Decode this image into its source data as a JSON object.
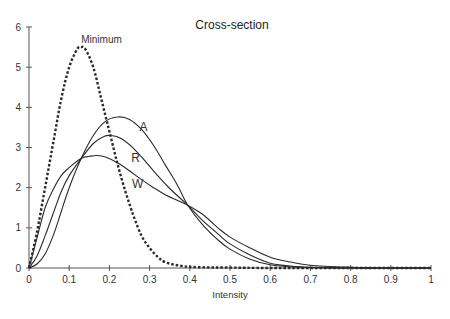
{
  "chart_data": {
    "type": "line",
    "title": "Cross-section",
    "xlabel": "Intensity",
    "ylabel": "",
    "xlim": [
      0,
      1
    ],
    "ylim": [
      0,
      6
    ],
    "grid": false,
    "legend": "inline labels",
    "x_ticks": [
      "0",
      "0.1",
      "0.2",
      "0.3",
      "0.4",
      "0.5",
      "0.6",
      "0.7",
      "0.8",
      "0.9",
      "1"
    ],
    "y_ticks": [
      "0",
      "1",
      "2",
      "3",
      "4",
      "5",
      "6"
    ],
    "series": [
      {
        "name": "Minimum",
        "style": "dashed",
        "x": [
          0,
          0.02,
          0.04,
          0.06,
          0.08,
          0.1,
          0.12,
          0.13,
          0.14,
          0.16,
          0.18,
          0.2,
          0.22,
          0.24,
          0.26,
          0.28,
          0.3,
          0.32,
          0.34,
          0.38,
          0.42,
          0.5,
          0.6,
          0.8,
          1.0
        ],
        "values": [
          0,
          0.9,
          2.0,
          3.1,
          4.2,
          5.0,
          5.45,
          5.5,
          5.45,
          5.0,
          4.2,
          3.4,
          2.6,
          1.9,
          1.3,
          0.8,
          0.5,
          0.28,
          0.14,
          0.05,
          0.02,
          0.01,
          0.0,
          0.0,
          0.0
        ]
      },
      {
        "name": "A",
        "style": "solid",
        "x": [
          0,
          0.02,
          0.04,
          0.06,
          0.08,
          0.1,
          0.13,
          0.16,
          0.19,
          0.22,
          0.25,
          0.28,
          0.31,
          0.34,
          0.37,
          0.395,
          0.43,
          0.47,
          0.5,
          0.55,
          0.6,
          0.65,
          0.7,
          0.8,
          0.9,
          1.0
        ],
        "values": [
          0,
          0.1,
          0.35,
          0.8,
          1.4,
          2.0,
          2.73,
          3.3,
          3.65,
          3.76,
          3.7,
          3.45,
          3.05,
          2.55,
          2.05,
          1.56,
          1.1,
          0.7,
          0.47,
          0.22,
          0.08,
          0.03,
          0.01,
          0.0,
          0.0,
          0.0
        ]
      },
      {
        "name": "R",
        "style": "solid",
        "x": [
          0,
          0.02,
          0.04,
          0.06,
          0.08,
          0.1,
          0.13,
          0.16,
          0.185,
          0.205,
          0.23,
          0.26,
          0.29,
          0.32,
          0.35,
          0.395,
          0.43,
          0.47,
          0.5,
          0.55,
          0.6,
          0.65,
          0.7,
          0.8,
          0.9,
          1.0
        ],
        "values": [
          0,
          0.3,
          0.8,
          1.35,
          1.9,
          2.3,
          2.73,
          3.1,
          3.27,
          3.3,
          3.22,
          2.98,
          2.65,
          2.3,
          1.98,
          1.56,
          1.2,
          0.85,
          0.6,
          0.32,
          0.12,
          0.05,
          0.02,
          0.0,
          0.0,
          0.0
        ]
      },
      {
        "name": "W",
        "style": "solid",
        "x": [
          0,
          0.02,
          0.04,
          0.06,
          0.08,
          0.1,
          0.13,
          0.15,
          0.17,
          0.19,
          0.22,
          0.25,
          0.28,
          0.31,
          0.34,
          0.37,
          0.395,
          0.43,
          0.47,
          0.5,
          0.55,
          0.6,
          0.65,
          0.7,
          0.8,
          0.9,
          1.0
        ],
        "values": [
          0,
          0.75,
          1.5,
          1.95,
          2.3,
          2.5,
          2.73,
          2.78,
          2.8,
          2.76,
          2.62,
          2.42,
          2.2,
          2.0,
          1.82,
          1.68,
          1.56,
          1.35,
          1.0,
          0.77,
          0.5,
          0.27,
          0.15,
          0.07,
          0.02,
          0.0,
          0.0
        ]
      }
    ],
    "annotations": [
      {
        "text": "Minimum",
        "x": 0.13,
        "y": 5.6
      },
      {
        "text": "A",
        "x": 0.285,
        "y": 3.4
      },
      {
        "text": "R",
        "x": 0.265,
        "y": 2.65
      },
      {
        "text": "W",
        "x": 0.27,
        "y": 2.0
      }
    ]
  }
}
